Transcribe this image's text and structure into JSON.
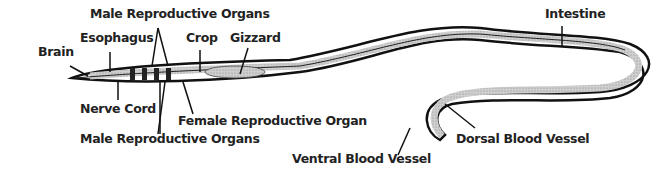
{
  "diagram": {
    "labels": {
      "brain": "Brain",
      "esophagus": "Esophagus",
      "male_top": "Male Reproductive Organs",
      "crop": "Crop",
      "gizzard": "Gizzard",
      "intestine": "Intestine",
      "nerve_cord": "Nerve Cord",
      "female": "Female Reproductive Organ",
      "male_bottom": "Male Reproductive Organs",
      "ventral": "Ventral Blood Vessel",
      "dorsal": "Dorsal Blood Vessel"
    }
  }
}
